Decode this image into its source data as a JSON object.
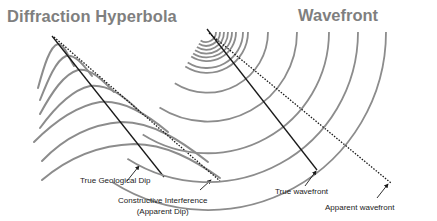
{
  "figure": {
    "left_panel": {
      "title": "Diffraction Hyperbola",
      "labels": {
        "true_dip": "True Geological Dip",
        "constructive_line1": "Constructive Interference",
        "constructive_line2": "(Apparent Dip)"
      },
      "hyperbola_count": 7
    },
    "right_panel": {
      "title": "Wavefront",
      "labels": {
        "true_wavefront": "True wavefront",
        "apparent_wavefront": "Apparent wavefront"
      },
      "arc_count": 13
    },
    "colors": {
      "title": "#7f7f7f",
      "curve": "#8c8c8c",
      "line": "#1a1a1a",
      "text": "#222222"
    }
  }
}
